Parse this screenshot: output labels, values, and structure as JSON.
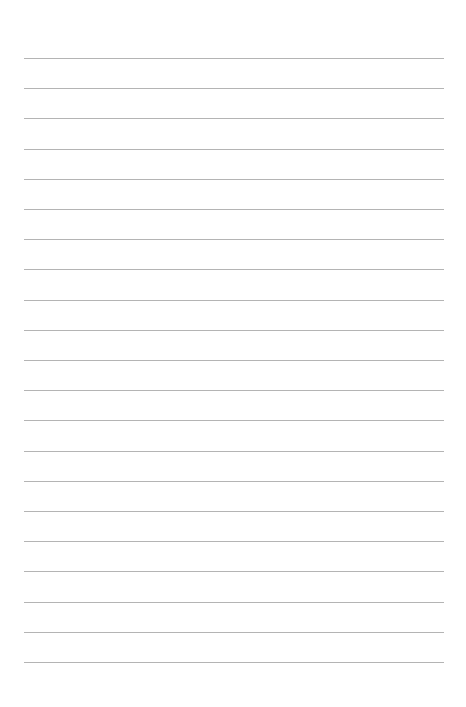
{
  "page": {
    "type": "lined-paper",
    "line_count": 21,
    "line_color": "#b4b4b4",
    "background_color": "#ffffff"
  }
}
